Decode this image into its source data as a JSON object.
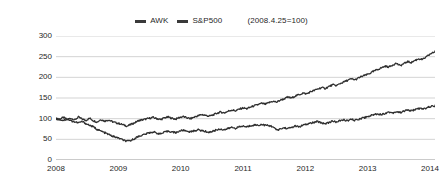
{
  "legend": {
    "entries": [
      {
        "label": "AWK",
        "swatch": "legend-swatch-awk",
        "color": "#3a3a3a"
      },
      {
        "label": "S&P500",
        "swatch": "legend-swatch-sp500",
        "color": "#3a3a3a"
      }
    ],
    "note": "(2008.4.25=100)"
  },
  "chart_data": {
    "type": "line",
    "title": "",
    "subtitle": "",
    "xlabel": "",
    "ylabel": "",
    "note": "(2008.4.25=100)",
    "grid": true,
    "legend_position": "top-center",
    "xlim": [
      2008.0,
      2014.08
    ],
    "ylim": [
      0,
      300
    ],
    "yticks": [
      0,
      50,
      100,
      150,
      200,
      250,
      300
    ],
    "ytick_labels": [
      "0",
      "50",
      "100",
      "150",
      "200",
      "250",
      "300"
    ],
    "xticks": [
      2008,
      2009,
      2010,
      2011,
      2012,
      2013,
      2014
    ],
    "xtick_labels": [
      "2008",
      "2009",
      "2010",
      "2011",
      "2012",
      "2013",
      "2014"
    ],
    "line_color": "#2f2f2f",
    "grid_color": "#c8c8c8",
    "series": [
      {
        "name": "AWK",
        "color": "#2f2f2f",
        "x": [
          2008.0,
          2008.06,
          2008.12,
          2008.18,
          2008.24,
          2008.3,
          2008.36,
          2008.42,
          2008.48,
          2008.54,
          2008.6,
          2008.66,
          2008.72,
          2008.78,
          2008.84,
          2008.9,
          2008.96,
          2009.02,
          2009.08,
          2009.14,
          2009.2,
          2009.26,
          2009.32,
          2009.38,
          2009.44,
          2009.5,
          2009.56,
          2009.62,
          2009.68,
          2009.74,
          2009.8,
          2009.86,
          2009.92,
          2009.98,
          2010.04,
          2010.1,
          2010.16,
          2010.22,
          2010.28,
          2010.34,
          2010.4,
          2010.46,
          2010.52,
          2010.58,
          2010.64,
          2010.7,
          2010.76,
          2010.82,
          2010.88,
          2010.94,
          2011.0,
          2011.06,
          2011.12,
          2011.18,
          2011.24,
          2011.3,
          2011.36,
          2011.42,
          2011.48,
          2011.54,
          2011.6,
          2011.66,
          2011.72,
          2011.78,
          2011.84,
          2011.9,
          2011.96,
          2012.02,
          2012.08,
          2012.14,
          2012.2,
          2012.26,
          2012.32,
          2012.38,
          2012.44,
          2012.5,
          2012.56,
          2012.62,
          2012.68,
          2012.74,
          2012.8,
          2012.86,
          2012.92,
          2012.98,
          2013.04,
          2013.1,
          2013.16,
          2013.22,
          2013.28,
          2013.34,
          2013.4,
          2013.46,
          2013.52,
          2013.58,
          2013.64,
          2013.7,
          2013.76,
          2013.82,
          2013.88,
          2013.94,
          2014.0,
          2014.08
        ],
        "values": [
          100,
          99,
          103,
          98,
          101,
          97,
          104,
          99,
          96,
          101,
          95,
          92,
          98,
          94,
          97,
          93,
          90,
          88,
          85,
          82,
          86,
          90,
          95,
          97,
          99,
          101,
          103,
          100,
          98,
          102,
          104,
          101,
          99,
          103,
          105,
          102,
          100,
          104,
          107,
          110,
          108,
          106,
          109,
          113,
          116,
          114,
          118,
          121,
          119,
          123,
          126,
          124,
          128,
          131,
          134,
          137,
          135,
          139,
          142,
          140,
          145,
          148,
          152,
          150,
          155,
          158,
          162,
          160,
          165,
          168,
          172,
          175,
          173,
          178,
          182,
          180,
          185,
          189,
          193,
          196,
          194,
          199,
          203,
          206,
          210,
          215,
          219,
          223,
          227,
          225,
          230,
          234,
          228,
          233,
          238,
          236,
          241,
          245,
          243,
          249,
          256,
          262
        ]
      },
      {
        "name": "S&P500",
        "color": "#2f2f2f",
        "x": [
          2008.0,
          2008.06,
          2008.12,
          2008.18,
          2008.24,
          2008.3,
          2008.36,
          2008.42,
          2008.48,
          2008.54,
          2008.6,
          2008.66,
          2008.72,
          2008.78,
          2008.84,
          2008.9,
          2008.96,
          2009.02,
          2009.08,
          2009.14,
          2009.2,
          2009.26,
          2009.32,
          2009.38,
          2009.44,
          2009.5,
          2009.56,
          2009.62,
          2009.68,
          2009.74,
          2009.8,
          2009.86,
          2009.92,
          2009.98,
          2010.04,
          2010.1,
          2010.16,
          2010.22,
          2010.28,
          2010.34,
          2010.4,
          2010.46,
          2010.52,
          2010.58,
          2010.64,
          2010.7,
          2010.76,
          2010.82,
          2010.88,
          2010.94,
          2011.0,
          2011.06,
          2011.12,
          2011.18,
          2011.24,
          2011.3,
          2011.36,
          2011.42,
          2011.48,
          2011.54,
          2011.6,
          2011.66,
          2011.72,
          2011.78,
          2011.84,
          2011.9,
          2011.96,
          2012.02,
          2012.08,
          2012.14,
          2012.2,
          2012.26,
          2012.32,
          2012.38,
          2012.44,
          2012.5,
          2012.56,
          2012.62,
          2012.68,
          2012.74,
          2012.8,
          2012.86,
          2012.92,
          2012.98,
          2013.04,
          2013.1,
          2013.16,
          2013.22,
          2013.28,
          2013.34,
          2013.4,
          2013.46,
          2013.52,
          2013.58,
          2013.64,
          2013.7,
          2013.76,
          2013.82,
          2013.88,
          2013.94,
          2014.0,
          2014.08
        ],
        "values": [
          100,
          98,
          96,
          99,
          95,
          92,
          90,
          93,
          88,
          84,
          80,
          74,
          70,
          66,
          62,
          58,
          55,
          52,
          48,
          45,
          47,
          52,
          57,
          60,
          63,
          66,
          68,
          65,
          63,
          67,
          70,
          68,
          66,
          70,
          72,
          70,
          68,
          71,
          73,
          71,
          69,
          67,
          70,
          73,
          75,
          73,
          76,
          79,
          77,
          80,
          82,
          80,
          83,
          85,
          84,
          86,
          84,
          83,
          81,
          72,
          75,
          78,
          76,
          79,
          82,
          80,
          84,
          86,
          89,
          91,
          93,
          90,
          88,
          91,
          94,
          92,
          95,
          97,
          95,
          98,
          96,
          99,
          102,
          104,
          107,
          110,
          112,
          110,
          113,
          116,
          114,
          117,
          115,
          118,
          121,
          119,
          122,
          125,
          123,
          126,
          129,
          131
        ]
      }
    ]
  }
}
